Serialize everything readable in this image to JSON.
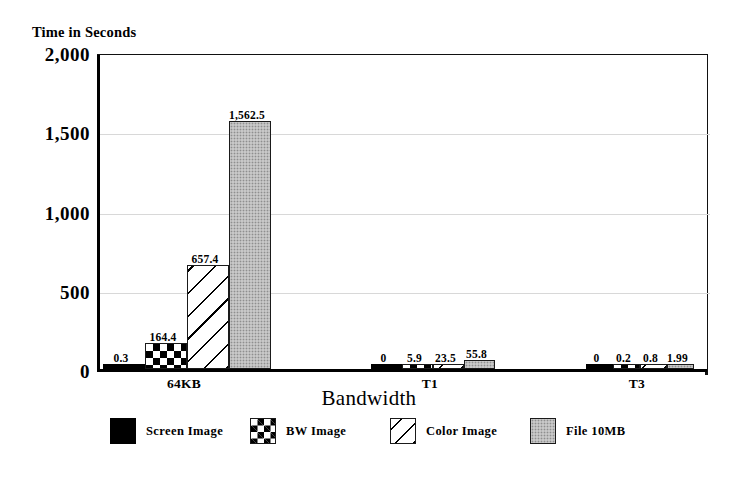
{
  "chart_data": {
    "type": "bar",
    "title": "",
    "ylabel": "Time in Seconds",
    "xlabel": "Bandwidth",
    "ylim": [
      0,
      2000
    ],
    "yticks": [
      0,
      500,
      1000,
      1500,
      2000
    ],
    "ytick_labels": [
      "0",
      "500",
      "1,000",
      "1,500",
      "2,000"
    ],
    "grid": true,
    "grid_axis": "y",
    "legend_position": "bottom",
    "categories": [
      "64KB",
      "T1",
      "T3"
    ],
    "series": [
      {
        "name": "Screen Image",
        "pattern": "solid",
        "color": "#000000",
        "values": [
          0.3,
          0,
          0
        ],
        "labels": [
          "0.3",
          "0",
          "0"
        ]
      },
      {
        "name": "BW Image",
        "pattern": "checker",
        "color": "#000000",
        "values": [
          164.4,
          5.9,
          0.2
        ],
        "labels": [
          "164.4",
          "5.9",
          "0.2"
        ]
      },
      {
        "name": "Color Image",
        "pattern": "hatch",
        "color": "#ffffff",
        "values": [
          657.4,
          23.5,
          0.8
        ],
        "labels": [
          "657.4",
          "23.5",
          "0.8"
        ]
      },
      {
        "name": "File 10MB",
        "pattern": "dots",
        "color": "#b6b6b6",
        "values": [
          1562.5,
          55.8,
          1.99
        ],
        "labels": [
          "1,562.5",
          "55.8",
          "1.99"
        ]
      }
    ]
  },
  "axes": {
    "y_title": "Time in Seconds",
    "x_title": "Bandwidth"
  },
  "colors": {
    "axis": "#000000",
    "gridline": "#d8d8d8",
    "bar_fill_gray": "#b6b6b6",
    "background": "#ffffff"
  }
}
